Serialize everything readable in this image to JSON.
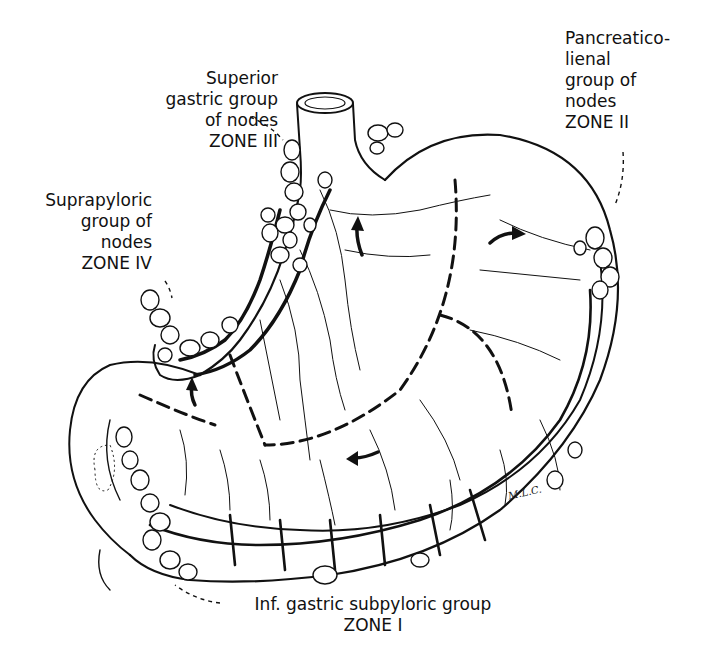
{
  "figure": {
    "signature": "M.L.C."
  },
  "labels": {
    "zone3": {
      "lines": [
        "Superior",
        "gastric group",
        "of nodes",
        "ZONE III"
      ]
    },
    "zone2": {
      "lines": [
        "Pancreatico-",
        "lienal",
        "group of",
        "nodes",
        "ZONE II"
      ]
    },
    "zone4": {
      "lines": [
        "Suprapyloric",
        "group of",
        "nodes",
        "ZONE IV"
      ]
    },
    "zone1": {
      "lines": [
        "Inf. gastric subpyloric group",
        "ZONE I"
      ]
    }
  },
  "colors": {
    "ink": "#111111",
    "background": "#ffffff",
    "node_fill": "#ffffff"
  }
}
